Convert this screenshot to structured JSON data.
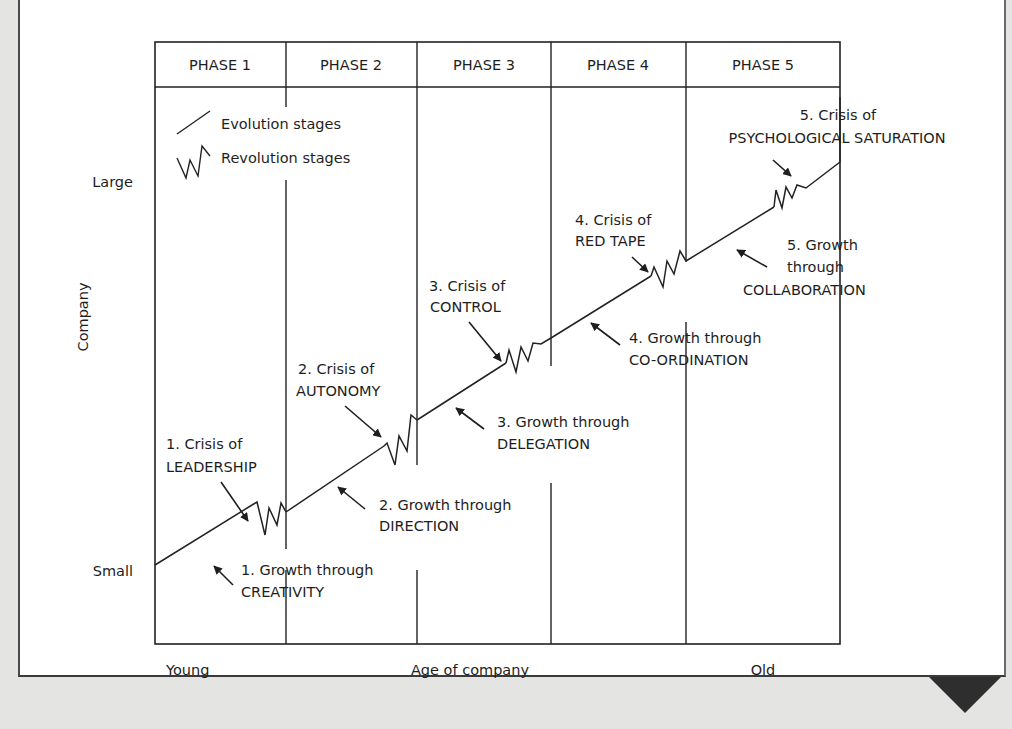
{
  "phases": [
    {
      "label": "PHASE 1",
      "x0": 155,
      "x1": 286
    },
    {
      "label": "PHASE 2",
      "x0": 286,
      "x1": 417
    },
    {
      "label": "PHASE 3",
      "x0": 417,
      "x1": 551
    },
    {
      "label": "PHASE 4",
      "x0": 551,
      "x1": 686
    },
    {
      "label": "PHASE 5",
      "x0": 686,
      "x1": 840
    }
  ],
  "legend": {
    "evolution_label": "Evolution stages",
    "revolution_label": "Revolution stages"
  },
  "axes": {
    "y_label": "Company",
    "y_top": "Large",
    "y_bottom": "Small",
    "x_label": "Age of company",
    "x_left": "Young",
    "x_right": "Old"
  },
  "stages": {
    "growth": [
      {
        "num": "1.",
        "line1": "Growth through",
        "line2": "CREATIVITY"
      },
      {
        "num": "2.",
        "line1": "Growth through",
        "line2": "DIRECTION"
      },
      {
        "num": "3.",
        "line1": "Growth through",
        "line2": "DELEGATION"
      },
      {
        "num": "4.",
        "line1": "Growth through",
        "line2": "CO-ORDINATION"
      },
      {
        "num": "5.",
        "line1": "Growth",
        "line1b": "through",
        "line2": "COLLABORATION"
      }
    ],
    "crisis": [
      {
        "num": "1.",
        "line1": "Crisis of",
        "line2": "LEADERSHIP"
      },
      {
        "num": "2.",
        "line1": "Crisis of",
        "line2": "AUTONOMY"
      },
      {
        "num": "3.",
        "line1": "Crisis of",
        "line2": "CONTROL"
      },
      {
        "num": "4.",
        "line1": "Crisis of",
        "line2": "RED TAPE"
      },
      {
        "num": "5.",
        "line1": "Crisis of",
        "line2": "PSYCHOLOGICAL SATURATION"
      }
    ]
  },
  "labels_full": {
    "g1a": "1. Growth through",
    "g1b": "CREATIVITY",
    "g2a": "2. Growth through",
    "g2b": "DIRECTION",
    "g3a": "3. Growth through",
    "g3b": "DELEGATION",
    "g4a": "4. Growth through",
    "g4b": "CO-ORDINATION",
    "g5a": "5. Growth",
    "g5b": "through",
    "g5c": "COLLABORATION",
    "c1a": "1. Crisis of",
    "c1b": "LEADERSHIP",
    "c2a": "2. Crisis of",
    "c2b": "AUTONOMY",
    "c3a": "3. Crisis of",
    "c3b": "CONTROL",
    "c4a": "4. Crisis of",
    "c4b": "RED TAPE",
    "c5a": "5. Crisis of",
    "c5b": "PSYCHOLOGICAL SATURATION"
  },
  "colors": {
    "ink": "#1e1e1e",
    "page_background": "#e4e4e2",
    "panel": "#ffffff"
  }
}
